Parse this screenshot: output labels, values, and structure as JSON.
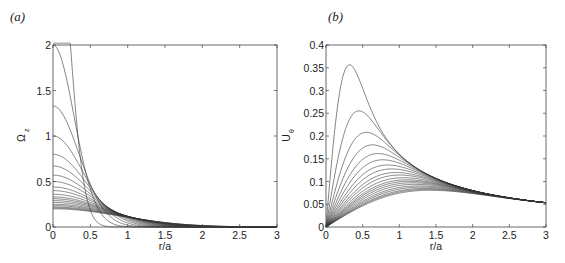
{
  "chart_data": [
    {
      "type": "line",
      "panel_label": "(a)",
      "title": "",
      "xlabel": "r/a",
      "ylabel": "Ω_z",
      "xlim": [
        0,
        3
      ],
      "ylim": [
        0,
        2
      ],
      "xticks": [
        "0",
        "0.5",
        "1",
        "1.5",
        "2",
        "2.5",
        "3"
      ],
      "yticks": [
        "0",
        "0.5",
        "1",
        "1.5",
        "2"
      ],
      "grid": false,
      "legend": null,
      "model": "Omega(r) = Omega0 * exp(-r^2 / s^2), with Omega0 * s^2 = 0.32",
      "series_peak_values_at_r0": [
        3.9,
        2.0,
        1.33,
        1.0,
        0.8,
        0.67,
        0.57,
        0.5,
        0.44,
        0.4,
        0.36,
        0.33,
        0.31,
        0.29,
        0.27,
        0.25,
        0.235,
        0.22,
        0.21,
        0.2
      ]
    },
    {
      "type": "line",
      "panel_label": "(b)",
      "title": "",
      "xlabel": "r/a",
      "ylabel": "U_θ",
      "xlim": [
        0,
        3
      ],
      "ylim": [
        0,
        0.4
      ],
      "xticks": [
        "0",
        "0.5",
        "1",
        "1.5",
        "2",
        "2.5",
        "3"
      ],
      "yticks": [
        "0",
        "0.05",
        "0.1",
        "0.15",
        "0.2",
        "0.25",
        "0.3",
        "0.35",
        "0.4"
      ],
      "grid": false,
      "legend": null,
      "model": "U(r) = (C / 2r) * (1 - exp(-r^2 / s^2)), C = 0.32",
      "series_peaks": [
        {
          "r": 0.32,
          "u": 0.358
        },
        {
          "r": 0.45,
          "u": 0.253
        },
        {
          "r": 0.55,
          "u": 0.206
        },
        {
          "r": 0.63,
          "u": 0.179
        }
      ],
      "value_at_r3": 0.053
    }
  ],
  "panels": {
    "a": {
      "label": "(a)",
      "xlabel": "r/a",
      "ylabel_main": "Ω",
      "ylabel_sub": "z"
    },
    "b": {
      "label": "(b)",
      "xlabel": "r/a",
      "ylabel_main": "U",
      "ylabel_sub": "θ"
    }
  }
}
